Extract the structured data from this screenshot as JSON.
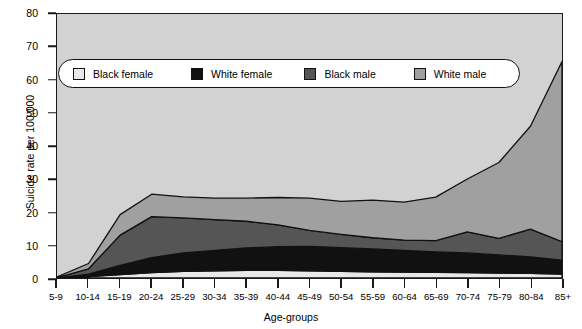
{
  "chart_data": {
    "type": "area",
    "stacked": true,
    "title": "",
    "xlabel": "Age-groups",
    "ylabel": "Suicide rate per 100,000",
    "ylim": [
      0,
      80
    ],
    "yticks": [
      0,
      10,
      20,
      30,
      40,
      50,
      60,
      70,
      80
    ],
    "grid": false,
    "legend_position": "top-left-inside",
    "categories": [
      "5-9",
      "10-14",
      "15-19",
      "20-24",
      "25-29",
      "30-34",
      "35-39",
      "40-44",
      "45-49",
      "50-54",
      "55-59",
      "60-64",
      "65-69",
      "70-74",
      "75-79",
      "80-84",
      "85+"
    ],
    "series": [
      {
        "name": "Black female",
        "color": "#e8e8e8",
        "values": [
          0.0,
          0.4,
          1.0,
          1.6,
          2.0,
          2.2,
          2.3,
          2.3,
          2.2,
          2.0,
          1.9,
          1.8,
          1.7,
          1.6,
          1.5,
          1.4,
          1.2
        ]
      },
      {
        "name": "White female",
        "color": "#111111",
        "values": [
          0.0,
          0.8,
          2.8,
          4.6,
          5.6,
          6.2,
          6.8,
          7.2,
          7.4,
          7.2,
          6.9,
          6.6,
          6.2,
          6.0,
          5.5,
          5.0,
          4.2
        ]
      },
      {
        "name": "Black male",
        "color": "#555555",
        "values": [
          0.1,
          1.6,
          9.2,
          12.4,
          10.6,
          9.3,
          8.1,
          6.6,
          4.8,
          4.0,
          3.4,
          3.1,
          3.4,
          6.4,
          5.0,
          8.4,
          5.6
        ]
      },
      {
        "name": "White male",
        "color": "#a0a0a0",
        "values": [
          0.2,
          1.6,
          6.2,
          6.8,
          6.4,
          6.5,
          7.0,
          8.3,
          9.8,
          10.0,
          11.4,
          11.5,
          13.2,
          16.0,
          23.0,
          31.2,
          54.6
        ]
      }
    ],
    "cumulative_totals": [
      0.3,
      4.4,
      19.2,
      25.4,
      24.6,
      24.2,
      24.2,
      24.4,
      24.2,
      23.2,
      23.6,
      23.0,
      24.5,
      30.0,
      35.0,
      46.0,
      65.6
    ]
  },
  "axes": {
    "y_title": "Suicide rate per 100,000",
    "x_title": "Age-groups"
  },
  "legend": {
    "items": [
      {
        "label": "Black female",
        "color": "#e8e8e8"
      },
      {
        "label": "White female",
        "color": "#111111"
      },
      {
        "label": "Black male",
        "color": "#555555"
      },
      {
        "label": "White male",
        "color": "#a0a0a0"
      }
    ]
  }
}
